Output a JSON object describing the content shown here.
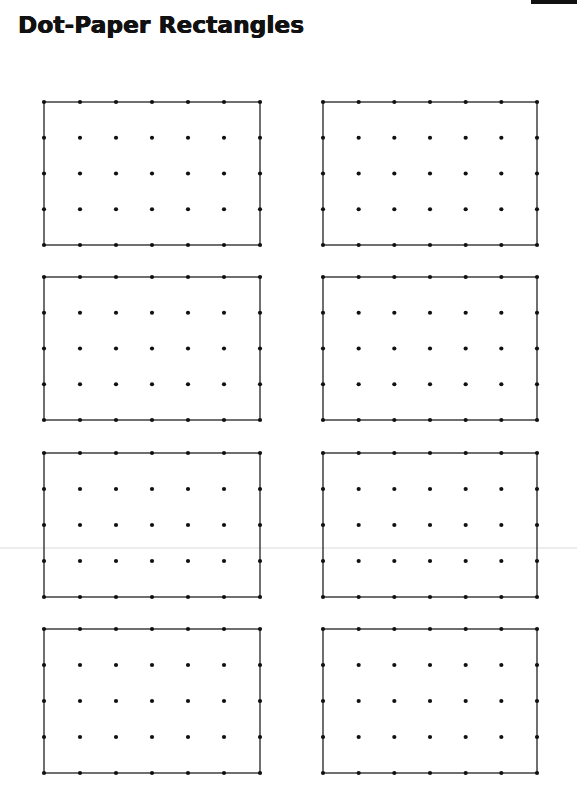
{
  "page": {
    "title": "Dot-Paper Rectangles"
  },
  "grid": {
    "columns_of_dots": 7,
    "rows_of_dots": 5,
    "dot_color": "#111111",
    "line_color": "#222222"
  },
  "rectangles": [
    {
      "id": 1,
      "x": 44,
      "y": 102,
      "w": 216,
      "h": 143
    },
    {
      "id": 2,
      "x": 323,
      "y": 102,
      "w": 214,
      "h": 143
    },
    {
      "id": 3,
      "x": 44,
      "y": 277,
      "w": 216,
      "h": 143
    },
    {
      "id": 4,
      "x": 323,
      "y": 277,
      "w": 214,
      "h": 143
    },
    {
      "id": 5,
      "x": 44,
      "y": 453,
      "w": 216,
      "h": 144
    },
    {
      "id": 6,
      "x": 323,
      "y": 453,
      "w": 214,
      "h": 144
    },
    {
      "id": 7,
      "x": 44,
      "y": 629,
      "w": 216,
      "h": 144
    },
    {
      "id": 8,
      "x": 323,
      "y": 629,
      "w": 214,
      "h": 144
    }
  ]
}
